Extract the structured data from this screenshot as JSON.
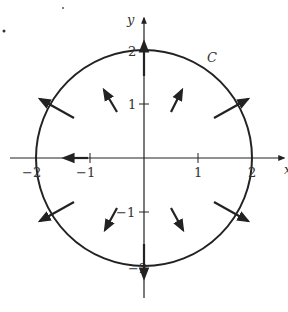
{
  "diagram": {
    "type": "vector-field-on-circle",
    "curve_label": "C",
    "axes": {
      "x_label": "x",
      "y_label": "y",
      "x_ticks": [
        "−2",
        "−1",
        "1",
        "2"
      ],
      "y_ticks": [
        "2",
        "1",
        "−1",
        "−2"
      ]
    },
    "circle": {
      "center": [
        0,
        0
      ],
      "radius": 2
    },
    "vectors": [
      {
        "at": [
          0,
          2
        ],
        "dir": "up"
      },
      {
        "at": [
          0,
          -2
        ],
        "dir": "down"
      },
      {
        "at": [
          -2,
          0
        ],
        "dir": "left"
      },
      {
        "at": [
          2,
          0
        ],
        "dir": "right"
      },
      {
        "at": [
          1.7,
          1.0
        ],
        "dir": "outward"
      },
      {
        "at": [
          -1.7,
          1.0
        ],
        "dir": "outward"
      },
      {
        "at": [
          1.7,
          -1.0
        ],
        "dir": "outward"
      },
      {
        "at": [
          -1.7,
          -1.0
        ],
        "dir": "outward"
      },
      {
        "at": [
          0.7,
          1.0
        ],
        "dir": "outward"
      },
      {
        "at": [
          -0.7,
          1.0
        ],
        "dir": "outward"
      },
      {
        "at": [
          0.7,
          -1.0
        ],
        "dir": "outward"
      },
      {
        "at": [
          -0.7,
          -1.0
        ],
        "dir": "outward"
      }
    ],
    "colors": {
      "ink": "#222222",
      "background": "#ffffff"
    }
  }
}
